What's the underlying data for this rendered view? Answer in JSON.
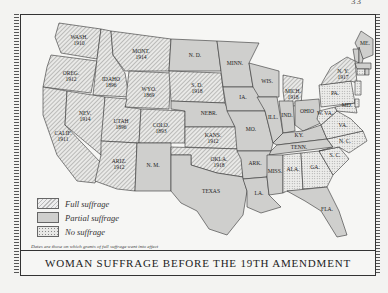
{
  "page": {
    "page_number": "33"
  },
  "map": {
    "title": "WOMAN SUFFRAGE BEFORE THE 19TH AMENDMENT",
    "note": "Dates are those on which grants of full suffrage went into effect",
    "colors": {
      "full": "#bdbdbb",
      "partial": "#cfcfcd",
      "none": "#e6e6e4",
      "water": "#f6f6f4",
      "outline": "#333333"
    },
    "legend": [
      {
        "key": "full",
        "label": "Full suffrage"
      },
      {
        "key": "partial",
        "label": "Partial suffrage"
      },
      {
        "key": "none",
        "label": "No suffrage"
      }
    ],
    "states": [
      {
        "abbr": "WASH.",
        "year": "1910",
        "status": "full"
      },
      {
        "abbr": "OREG.",
        "year": "1912",
        "status": "full"
      },
      {
        "abbr": "CALIF.",
        "year": "1911",
        "status": "full"
      },
      {
        "abbr": "IDAHO",
        "year": "1896",
        "status": "full"
      },
      {
        "abbr": "NEV.",
        "year": "1914",
        "status": "full"
      },
      {
        "abbr": "MONT.",
        "year": "1914",
        "status": "full"
      },
      {
        "abbr": "WYO.",
        "year": "1869",
        "status": "full"
      },
      {
        "abbr": "UTAH",
        "year": "1896",
        "status": "full"
      },
      {
        "abbr": "COLO.",
        "year": "1893",
        "status": "full"
      },
      {
        "abbr": "ARIZ.",
        "year": "1912",
        "status": "full"
      },
      {
        "abbr": "N. M.",
        "year": "",
        "status": "partial"
      },
      {
        "abbr": "N. D.",
        "year": "",
        "status": "partial"
      },
      {
        "abbr": "S. D.",
        "year": "1918",
        "status": "full"
      },
      {
        "abbr": "NEBR.",
        "year": "",
        "status": "partial"
      },
      {
        "abbr": "KANS.",
        "year": "1912",
        "status": "full"
      },
      {
        "abbr": "OKLA.",
        "year": "1918",
        "status": "full"
      },
      {
        "abbr": "TEXAS",
        "year": "",
        "status": "partial"
      },
      {
        "abbr": "MINN.",
        "year": "",
        "status": "partial"
      },
      {
        "abbr": "IA.",
        "year": "",
        "status": "partial"
      },
      {
        "abbr": "MO.",
        "year": "",
        "status": "partial"
      },
      {
        "abbr": "ARK.",
        "year": "",
        "status": "partial"
      },
      {
        "abbr": "LA.",
        "year": "",
        "status": "partial"
      },
      {
        "abbr": "WIS.",
        "year": "",
        "status": "partial"
      },
      {
        "abbr": "ILL.",
        "year": "",
        "status": "partial"
      },
      {
        "abbr": "MICH.",
        "year": "1918",
        "status": "full"
      },
      {
        "abbr": "IND.",
        "year": "",
        "status": "partial"
      },
      {
        "abbr": "OHIO",
        "year": "",
        "status": "partial"
      },
      {
        "abbr": "KY.",
        "year": "",
        "status": "partial"
      },
      {
        "abbr": "TENN.",
        "year": "",
        "status": "partial"
      },
      {
        "abbr": "MISS.",
        "year": "",
        "status": "partial"
      },
      {
        "abbr": "ALA.",
        "year": "",
        "status": "none"
      },
      {
        "abbr": "GA.",
        "year": "",
        "status": "none"
      },
      {
        "abbr": "FLA.",
        "year": "",
        "status": "partial"
      },
      {
        "abbr": "S. C.",
        "year": "",
        "status": "none"
      },
      {
        "abbr": "N. C.",
        "year": "",
        "status": "none"
      },
      {
        "abbr": "VA.",
        "year": "",
        "status": "none"
      },
      {
        "abbr": "W. VA.",
        "year": "",
        "status": "none"
      },
      {
        "abbr": "PA.",
        "year": "",
        "status": "none"
      },
      {
        "abbr": "MD.",
        "year": "",
        "status": "none"
      },
      {
        "abbr": "N. Y.",
        "year": "1917",
        "status": "full"
      },
      {
        "abbr": "ME.",
        "year": "",
        "status": "partial"
      },
      {
        "abbr": "VT.",
        "year": "",
        "status": "partial"
      },
      {
        "abbr": "N. H.",
        "year": "",
        "status": "partial"
      },
      {
        "abbr": "MASS.",
        "year": "",
        "status": "partial"
      },
      {
        "abbr": "CONN.",
        "year": "",
        "status": "none"
      },
      {
        "abbr": "R. I.",
        "year": "",
        "status": "partial"
      },
      {
        "abbr": "N. J.",
        "year": "",
        "status": "none"
      },
      {
        "abbr": "DEL.",
        "year": "",
        "status": "none"
      }
    ]
  }
}
